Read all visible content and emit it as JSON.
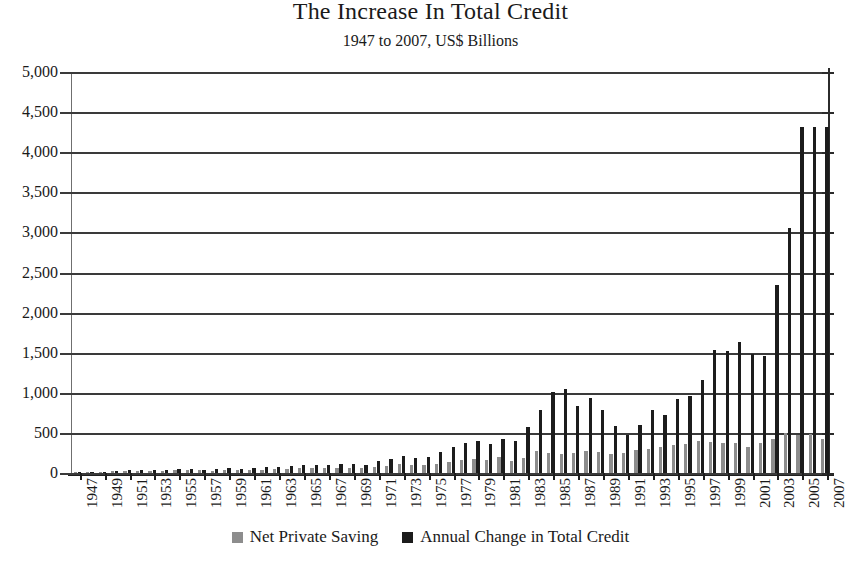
{
  "chart_data": {
    "type": "bar",
    "title": "The Increase In Total Credit",
    "subtitle": "1947 to 2007, US$ Billions",
    "xlabel": "",
    "ylabel": "",
    "ylim": [
      0,
      5000
    ],
    "ytick_step": 500,
    "ytick_labels": [
      "5,000",
      "4,500",
      "4,000",
      "3,500",
      "3,000",
      "2,500",
      "2,000",
      "1,500",
      "1,000",
      "500",
      "0"
    ],
    "grid": true,
    "legend_position": "bottom",
    "x": [
      1947,
      1948,
      1949,
      1950,
      1951,
      1952,
      1953,
      1954,
      1955,
      1956,
      1957,
      1958,
      1959,
      1960,
      1961,
      1962,
      1963,
      1964,
      1965,
      1966,
      1967,
      1968,
      1969,
      1970,
      1971,
      1972,
      1973,
      1974,
      1975,
      1976,
      1977,
      1978,
      1979,
      1980,
      1981,
      1982,
      1983,
      1984,
      1985,
      1986,
      1987,
      1988,
      1989,
      1990,
      1991,
      1992,
      1993,
      1994,
      1995,
      1996,
      1997,
      1998,
      1999,
      2000,
      2001,
      2002,
      2003,
      2004,
      2005,
      2006,
      2007
    ],
    "xtick_labels": [
      "1947",
      "1949",
      "1951",
      "1953",
      "1955",
      "1957",
      "1959",
      "1961",
      "1963",
      "1965",
      "1967",
      "1969",
      "1971",
      "1973",
      "1975",
      "1977",
      "1979",
      "1981",
      "1983",
      "1985",
      "1987",
      "1989",
      "1991",
      "1993",
      "1995",
      "1997",
      "1999",
      "2001",
      "2003",
      "2005",
      "2007"
    ],
    "series": [
      {
        "name": "Net Private Saving",
        "color": "#8d8d8d",
        "values": [
          12,
          14,
          12,
          20,
          24,
          24,
          24,
          22,
          32,
          33,
          32,
          27,
          38,
          32,
          36,
          43,
          45,
          54,
          62,
          64,
          62,
          60,
          58,
          58,
          75,
          88,
          110,
          100,
          98,
          118,
          140,
          165,
          175,
          160,
          195,
          155,
          190,
          270,
          250,
          235,
          250,
          275,
          260,
          240,
          255,
          290,
          300,
          330,
          350,
          360,
          400,
          390,
          370,
          380,
          330,
          370,
          430,
          500,
          480,
          490,
          420
        ]
      },
      {
        "name": "Annual Change in Total Credit",
        "color": "#1c1c1c",
        "values": [
          14,
          16,
          14,
          30,
          33,
          34,
          32,
          34,
          48,
          45,
          43,
          47,
          62,
          50,
          60,
          70,
          78,
          85,
          95,
          100,
          95,
          110,
          108,
          100,
          145,
          180,
          210,
          185,
          200,
          260,
          320,
          380,
          400,
          360,
          420,
          400,
          570,
          790,
          1010,
          1050,
          830,
          940,
          790,
          580,
          470,
          600,
          780,
          720,
          920,
          960,
          1160,
          1530,
          1520,
          1630,
          1490,
          1460,
          2340,
          3060,
          4320,
          4320,
          4320
        ]
      }
    ],
    "notable_peaks": {
      "1985": 1010,
      "1986": 1050,
      "1998": 1530,
      "2002": 1460,
      "2003": 2340,
      "2004": 3060,
      "2005": 4320,
      "2006": 4320,
      "2007": 4320
    }
  },
  "legend": {
    "items": [
      {
        "label": "Net Private Saving"
      },
      {
        "label": "Annual Change in Total Credit"
      }
    ]
  }
}
